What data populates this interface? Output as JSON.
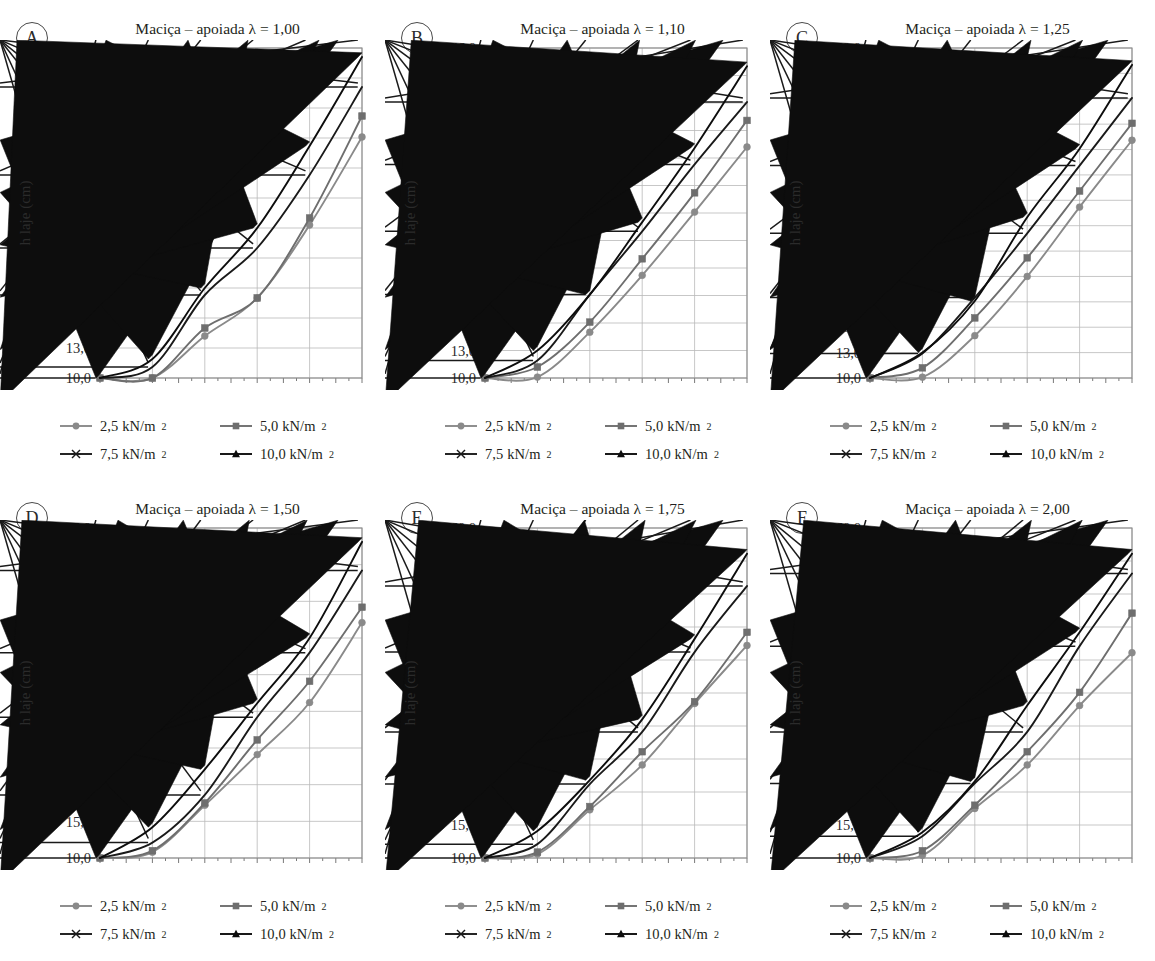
{
  "figure": {
    "axis_x_label": "Vão (m)",
    "axis_y_label": "h laje (cm)",
    "x_ticks": [
      "2",
      "3",
      "4",
      "5",
      "6",
      "7",
      "8",
      "9",
      "10",
      "11",
      "12"
    ],
    "series_colors": {
      "2,5 kN/m2": "#8a8a8a",
      "5,0 kN/m2": "#6e6e6e",
      "7,5 kN/m2": "#1a1a1a",
      "10,0 kN/m2": "#0d0d0d"
    },
    "legend": [
      {
        "label": "2,5 kN/m",
        "sup": "2",
        "marker": "circle",
        "color": "#8a8a8a"
      },
      {
        "label": "5,0 kN/m",
        "sup": "2",
        "marker": "square",
        "color": "#6e6e6e"
      },
      {
        "label": "7,5 kN/m",
        "sup": "2",
        "marker": "asterisk",
        "color": "#1a1a1a"
      },
      {
        "label": "10,0 kN/m",
        "sup": "2",
        "marker": "triangle",
        "color": "#0d0d0d"
      }
    ]
  },
  "chart_data": [
    {
      "type": "line",
      "panel": "A",
      "title": "Maciça – apoiada λ = 1,00",
      "xlabel": "Vão (m)",
      "ylabel": "h laje (cm)",
      "x": [
        2,
        4,
        6,
        8,
        10,
        12
      ],
      "xlim": [
        2,
        12
      ],
      "ylim": [
        10.0,
        43.0
      ],
      "ytick_step": 3.0,
      "ytick_labels": [
        "10,0",
        "13,0",
        "16,0",
        "19,0",
        "22,0",
        "25,0",
        "28,0",
        "31,0",
        "34,0",
        "37,0",
        "40,0",
        "43,0"
      ],
      "grid": true,
      "legend_position": "below",
      "series": [
        {
          "name": "2,5 kN/m2",
          "values": [
            10.0,
            10.0,
            14.2,
            18.0,
            25.3,
            34.1
          ]
        },
        {
          "name": "5,0 kN/m2",
          "values": [
            10.0,
            10.0,
            15.0,
            18.0,
            26.0,
            36.2
          ]
        },
        {
          "name": "7,5 kN/m2",
          "values": [
            10.0,
            11.1,
            18.3,
            23.0,
            30.3,
            39.1
          ]
        },
        {
          "name": "10,0 kN/m2",
          "values": [
            10.0,
            11.9,
            19.0,
            25.0,
            33.2,
            42.1
          ]
        }
      ]
    },
    {
      "type": "line",
      "panel": "B",
      "title": "Maciça – apoiada λ = 1,10",
      "xlabel": "Vão (m)",
      "ylabel": "h laje (cm)",
      "x": [
        2,
        4,
        6,
        8,
        10,
        12
      ],
      "xlim": [
        2,
        12
      ],
      "ylim": [
        10.0,
        46.0
      ],
      "ytick_step": 3.0,
      "ytick_labels": [
        "10,0",
        "13,0",
        "16,0",
        "19,0",
        "22,0",
        "25,0",
        "28,0",
        "31,0",
        "34,0",
        "37,0",
        "40,0",
        "43,0",
        "46,0"
      ],
      "grid": true,
      "legend_position": "below",
      "series": [
        {
          "name": "2,5 kN/m2",
          "values": [
            10.0,
            10.1,
            15.0,
            21.2,
            28.1,
            35.2
          ]
        },
        {
          "name": "5,0 kN/m2",
          "values": [
            10.0,
            11.2,
            16.1,
            23.0,
            30.2,
            38.1
          ]
        },
        {
          "name": "7,5 kN/m2",
          "values": [
            10.0,
            11.9,
            19.1,
            26.0,
            33.3,
            40.1
          ]
        },
        {
          "name": "10,0 kN/m2",
          "values": [
            10.0,
            13.0,
            19.1,
            27.0,
            35.1,
            44.0
          ]
        }
      ]
    },
    {
      "type": "line",
      "panel": "C",
      "title": "Maciça – apoiada λ = 1,25",
      "xlabel": "Vão (m)",
      "ylabel": "h laje (cm)",
      "x": [
        2,
        4,
        6,
        8,
        10,
        12
      ],
      "xlim": [
        2,
        12
      ],
      "ylim": [
        10.0,
        49.0
      ],
      "ytick_step": 3.0,
      "ytick_labels": [
        "10,0",
        "13,0",
        "16,0",
        "19,0",
        "22,0",
        "25,0",
        "28,0",
        "31,0",
        "34,0",
        "37,0",
        "40,0",
        "43,0",
        "46,0",
        "49,0"
      ],
      "grid": true,
      "legend_position": "below",
      "series": [
        {
          "name": "2,5 kN/m2",
          "values": [
            10.0,
            10.1,
            15.0,
            22.0,
            30.2,
            38.1
          ]
        },
        {
          "name": "5,0 kN/m2",
          "values": [
            10.0,
            11.2,
            17.1,
            24.2,
            32.1,
            40.1
          ]
        },
        {
          "name": "7,5 kN/m2",
          "values": [
            10.0,
            12.9,
            19.5,
            27.1,
            35.1,
            43.1
          ]
        },
        {
          "name": "10,0 kN/m2",
          "values": [
            10.0,
            13.0,
            19.1,
            29.0,
            37.1,
            47.0
          ]
        }
      ]
    },
    {
      "type": "line",
      "panel": "D",
      "title": "Maciça – apoiada λ = 1,50",
      "xlabel": "Vão (m)",
      "ylabel": "h laje (cm)",
      "x": [
        2,
        4,
        6,
        8,
        10,
        12
      ],
      "xlim": [
        2,
        12
      ],
      "ylim": [
        10.0,
        55.0
      ],
      "ytick_step": 5.0,
      "ytick_labels": [
        "10,0",
        "15,0",
        "20,0",
        "25,0",
        "30,0",
        "35,0",
        "40,0",
        "45,0",
        "50,0",
        "55,0"
      ],
      "grid": true,
      "legend_position": "below",
      "series": [
        {
          "name": "2,5 kN/m2",
          "values": [
            10.0,
            10.8,
            17.2,
            24.1,
            31.2,
            42.1
          ]
        },
        {
          "name": "5,0 kN/m2",
          "values": [
            10.0,
            11.0,
            17.5,
            26.1,
            34.1,
            44.2
          ]
        },
        {
          "name": "7,5 kN/m2",
          "values": [
            10.0,
            12.1,
            18.6,
            29.2,
            38.0,
            49.2
          ]
        },
        {
          "name": "10,0 kN/m2",
          "values": [
            10.0,
            14.2,
            22.1,
            31.1,
            40.0,
            53.1
          ]
        }
      ]
    },
    {
      "type": "line",
      "panel": "E",
      "title": "Maciça – apoiada λ = 1,75",
      "xlabel": "Vão (m)",
      "ylabel": "h laje (cm)",
      "x": [
        2,
        4,
        6,
        8,
        10,
        12
      ],
      "xlim": [
        2,
        12
      ],
      "ylim": [
        10.0,
        60.0
      ],
      "ytick_step": 5.0,
      "ytick_labels": [
        "10,0",
        "15,0",
        "20,0",
        "25,0",
        "30,0",
        "35,0",
        "40,0",
        "45,0",
        "50,0",
        "55,0",
        "60,0"
      ],
      "grid": true,
      "legend_position": "below",
      "series": [
        {
          "name": "2,5 kN/m2",
          "values": [
            10.0,
            10.6,
            17.3,
            24.1,
            33.4,
            42.2
          ]
        },
        {
          "name": "5,0 kN/m2",
          "values": [
            10.0,
            10.9,
            17.8,
            26.1,
            33.7,
            44.2
          ]
        },
        {
          "name": "7,5 kN/m2",
          "values": [
            10.0,
            12.1,
            21.2,
            29.1,
            41.2,
            51.2
          ]
        },
        {
          "name": "10,0 kN/m2",
          "values": [
            10.0,
            14.1,
            21.8,
            31.0,
            43.2,
            56.1
          ]
        }
      ]
    },
    {
      "type": "line",
      "panel": "F",
      "title": "Maciça – apoiada λ = 2,00",
      "xlabel": "Vão (m)",
      "ylabel": "h laje (cm)",
      "x": [
        2,
        4,
        6,
        8,
        10,
        12
      ],
      "xlim": [
        2,
        12
      ],
      "ylim": [
        10.0,
        60.0
      ],
      "ytick_step": 5.0,
      "ytick_labels": [
        "10,0",
        "15,0",
        "20,0",
        "25,0",
        "30,0",
        "35,0",
        "40,0",
        "45,0",
        "50,0",
        "55,0",
        "60,0"
      ],
      "grid": true,
      "legend_position": "below",
      "series": [
        {
          "name": "2,5 kN/m2",
          "values": [
            10.0,
            10.4,
            17.5,
            24.1,
            33.1,
            41.1
          ]
        },
        {
          "name": "5,0 kN/m2",
          "values": [
            10.0,
            11.1,
            18.0,
            26.1,
            35.1,
            47.1
          ]
        },
        {
          "name": "7,5 kN/m2",
          "values": [
            10.0,
            13.3,
            21.3,
            29.1,
            42.1,
            53.1
          ]
        },
        {
          "name": "10,0 kN/m2",
          "values": [
            10.0,
            13.9,
            21.6,
            33.1,
            44.2,
            56.1
          ]
        }
      ]
    }
  ]
}
